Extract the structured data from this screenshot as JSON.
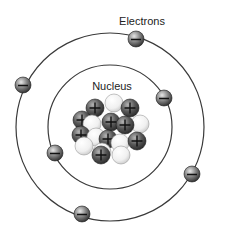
{
  "diagram": {
    "labels": {
      "electrons": "Electrons",
      "nucleus": "Nucleus"
    },
    "colors": {
      "background": "#ffffff",
      "orbit": "#3a3a3a",
      "electron_dark": "#2a2a2a",
      "electron_light": "#cfcfcf",
      "proton_dark": "#2e2e2e",
      "proton_light": "#a8a8a8",
      "neutron_dark": "#c8c8c8",
      "neutron_light": "#fbfbfb"
    },
    "orbits": [
      {
        "name": "inner-orbit",
        "cx": 110,
        "cy": 127,
        "r": 62
      },
      {
        "name": "outer-orbit",
        "cx": 110,
        "cy": 127,
        "r": 94
      }
    ],
    "electrons": [
      {
        "x": 136,
        "y": 39,
        "orbit": "outer",
        "charge": "-"
      },
      {
        "x": 23,
        "y": 85,
        "orbit": "outer",
        "charge": "-"
      },
      {
        "x": 164,
        "y": 98,
        "orbit": "inner",
        "charge": "-"
      },
      {
        "x": 55,
        "y": 153,
        "orbit": "inner",
        "charge": "-"
      },
      {
        "x": 192,
        "y": 174,
        "orbit": "outer",
        "charge": "-"
      },
      {
        "x": 82,
        "y": 214,
        "orbit": "outer",
        "charge": "-"
      }
    ],
    "nucleus": {
      "particles": [
        {
          "type": "neutron",
          "x": 114,
          "y": 103
        },
        {
          "type": "proton",
          "x": 95,
          "y": 108
        },
        {
          "type": "proton",
          "x": 130,
          "y": 108
        },
        {
          "type": "proton",
          "x": 82,
          "y": 120
        },
        {
          "type": "neutron",
          "x": 140,
          "y": 124
        },
        {
          "type": "neutron",
          "x": 92,
          "y": 124
        },
        {
          "type": "proton",
          "x": 111,
          "y": 122
        },
        {
          "type": "proton",
          "x": 125,
          "y": 125
        },
        {
          "type": "proton",
          "x": 81,
          "y": 135
        },
        {
          "type": "neutron",
          "x": 96,
          "y": 137
        },
        {
          "type": "neutron",
          "x": 84,
          "y": 146
        },
        {
          "type": "proton",
          "x": 108,
          "y": 139
        },
        {
          "type": "neutron",
          "x": 120,
          "y": 143
        },
        {
          "type": "proton",
          "x": 137,
          "y": 141
        },
        {
          "type": "neutron",
          "x": 102,
          "y": 152
        },
        {
          "type": "proton",
          "x": 101,
          "y": 155
        },
        {
          "type": "neutron",
          "x": 121,
          "y": 155
        }
      ]
    },
    "label_positions": {
      "electrons": {
        "x": 142,
        "y": 25
      },
      "nucleus": {
        "x": 112,
        "y": 90
      }
    }
  }
}
